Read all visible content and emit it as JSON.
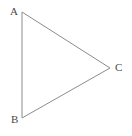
{
  "figure": {
    "type": "triangle-diagram",
    "width": 132,
    "height": 136,
    "background_color": "#ffffff",
    "stroke_color": "#8c8c8c",
    "stroke_width": 1,
    "label_color": "#4a4a4a"
  },
  "vertices": [
    {
      "id": "A",
      "label": "A",
      "x": 22,
      "y": 12,
      "label_x": 10,
      "label_y": 6
    },
    {
      "id": "B",
      "label": "B",
      "x": 22,
      "y": 118,
      "label_x": 11,
      "label_y": 114
    },
    {
      "id": "C",
      "label": "C",
      "x": 110,
      "y": 68,
      "label_x": 115,
      "label_y": 62
    }
  ],
  "edges": [
    {
      "id": "AB",
      "from": "A",
      "to": "B",
      "points": "22,12 22,118"
    },
    {
      "id": "AC",
      "from": "A",
      "to": "C",
      "points": "22,12 110,68"
    },
    {
      "id": "BC",
      "from": "B",
      "to": "C",
      "points": "22,118 110,68"
    }
  ],
  "path": {
    "triangle_points": "22,12 110,68 22,118"
  }
}
